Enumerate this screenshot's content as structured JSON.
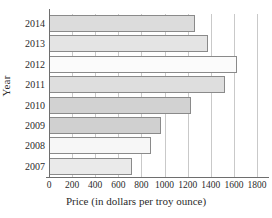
{
  "chart_data": {
    "type": "bar",
    "orientation": "horizontal",
    "title": "",
    "xlabel": "Price (in dollars per troy ounce)",
    "ylabel": "Year",
    "categories": [
      "2014",
      "2013",
      "2012",
      "2011",
      "2010",
      "2009",
      "2008",
      "2007"
    ],
    "values": [
      1265,
      1375,
      1630,
      1520,
      1225,
      965,
      880,
      720
    ],
    "xlim": [
      0,
      1800
    ],
    "xticks": [
      0,
      200,
      400,
      600,
      800,
      1000,
      1200,
      1400,
      1600,
      1800
    ],
    "xtick_labels": [
      "0",
      "200",
      "400",
      "600",
      "800",
      "1000",
      "1200",
      "1400",
      "1600",
      "1800"
    ],
    "grid": "vertical",
    "legend": "none",
    "bar_fills": [
      "#dcdcdc",
      "#e4e4e4",
      "#fbfbfb",
      "#dedede",
      "#d2d2d2",
      "#d0d0d0",
      "#f7f7f7",
      "#eaeaea"
    ],
    "bar_edge_color": "#8a8a8a",
    "axis_color": "#6e6e6e",
    "gridline_color": "#c9c9c9"
  }
}
